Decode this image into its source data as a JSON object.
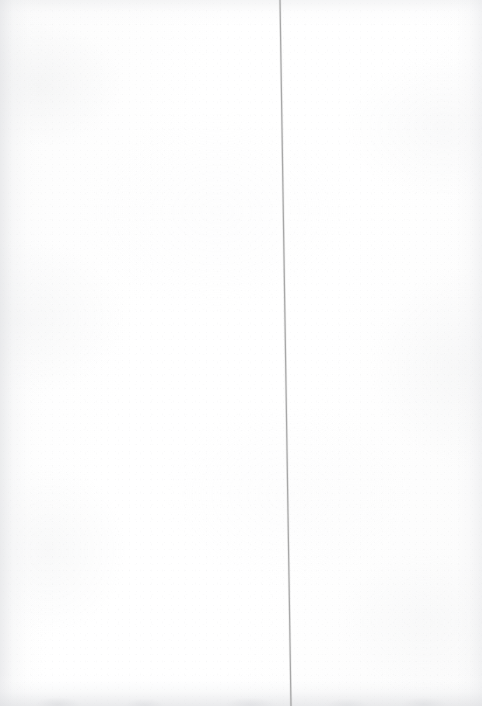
{
  "page": {
    "kind": "scanned-blank-page",
    "width": 482,
    "height": 706,
    "background_color": "#fefefe",
    "paper_tone": "#fdfdfd",
    "text_content": "",
    "caption": ""
  },
  "marks": {
    "vertical_rule": {
      "label": "vertical-rule",
      "description": "thin grey vertical line leaning slightly to the right",
      "color": "#9a9a9a",
      "stroke_width": 1.2,
      "top_x": 280,
      "top_y": 0,
      "bottom_x": 291,
      "bottom_y": 706,
      "opacity": 0.85
    }
  },
  "artifacts": {
    "left_edge_shadow": "#dedfe2",
    "right_edge_shadow": "#e4e5e8",
    "top_edge_shadow": "#e6e7e9",
    "bottom_edge_shadow": "#dddee1",
    "grain_color": "#bec0c4"
  }
}
